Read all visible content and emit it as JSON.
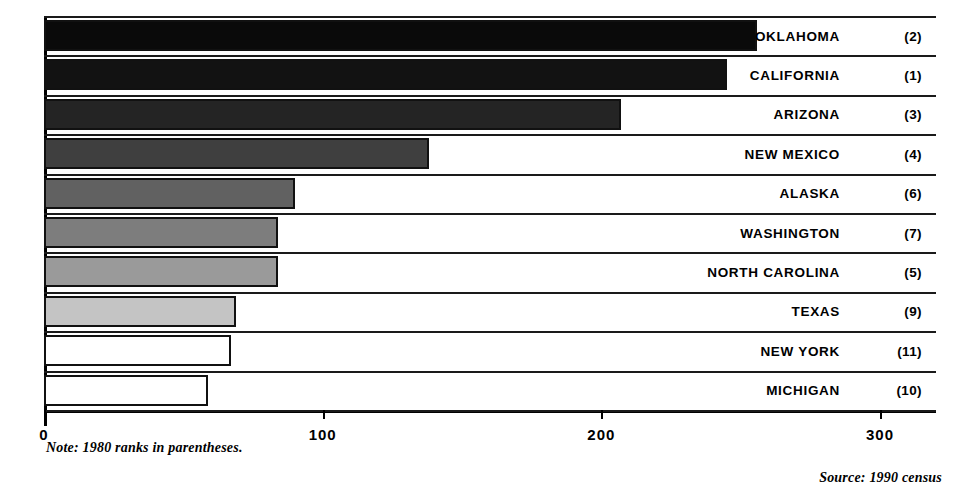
{
  "chart_data": {
    "type": "bar",
    "orientation": "horizontal",
    "title": "",
    "xlabel": "",
    "ylabel": "",
    "xlim": [
      0,
      300
    ],
    "xticks": [
      "0",
      "100",
      "200",
      "300"
    ],
    "xtick_values": [
      0,
      100,
      200,
      300
    ],
    "grid": false,
    "legend": "none",
    "categories": [
      "OKLAHOMA",
      "CALIFORNIA",
      "ARIZONA",
      "NEW MEXICO",
      "ALASKA",
      "WASHINGTON",
      "NORTH CAROLINA",
      "TEXAS",
      "NEW YORK",
      "MICHIGAN"
    ],
    "values": [
      256,
      245,
      207,
      138,
      90,
      84,
      84,
      69,
      67,
      59
    ],
    "annotations": [
      "(2)",
      "(1)",
      "(3)",
      "(4)",
      "(6)",
      "(7)",
      "(5)",
      "(9)",
      "(11)",
      "(10)"
    ],
    "bar_fills": [
      "#0a0a0a",
      "#121212",
      "#242424",
      "#3f3f3f",
      "#616161",
      "#7d7d7d",
      "#9a9a9a",
      "#c4c4c4",
      "#ffffff",
      "#ffffff"
    ],
    "note": "Note: 1980 ranks in parentheses.",
    "source": "Source: 1990 census"
  },
  "axis": {
    "ticks": [
      {
        "label": "0",
        "value": 0
      },
      {
        "label": "100",
        "value": 100
      },
      {
        "label": "200",
        "value": 200
      },
      {
        "label": "300",
        "value": 300
      }
    ]
  },
  "footer": {
    "note": "Note: 1980 ranks in parentheses.",
    "source": "Source: 1990 census"
  },
  "rows": [
    {
      "label": "OKLAHOMA",
      "rank": "(2)",
      "value": 256,
      "fill": "#0a0a0a"
    },
    {
      "label": "CALIFORNIA",
      "rank": "(1)",
      "value": 245,
      "fill": "#121212"
    },
    {
      "label": "ARIZONA",
      "rank": "(3)",
      "value": 207,
      "fill": "#242424"
    },
    {
      "label": "NEW MEXICO",
      "rank": "(4)",
      "value": 138,
      "fill": "#3f3f3f"
    },
    {
      "label": "ALASKA",
      "rank": "(6)",
      "value": 90,
      "fill": "#616161"
    },
    {
      "label": "WASHINGTON",
      "rank": "(7)",
      "value": 84,
      "fill": "#7d7d7d"
    },
    {
      "label": "NORTH CAROLINA",
      "rank": "(5)",
      "value": 84,
      "fill": "#9a9a9a"
    },
    {
      "label": "TEXAS",
      "rank": "(9)",
      "value": 69,
      "fill": "#c4c4c4"
    },
    {
      "label": "NEW YORK",
      "rank": "(11)",
      "value": 67,
      "fill": "#ffffff"
    },
    {
      "label": "MICHIGAN",
      "rank": "(10)",
      "value": 59,
      "fill": "#ffffff"
    }
  ]
}
